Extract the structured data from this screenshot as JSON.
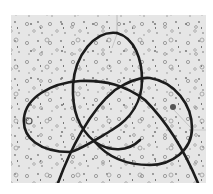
{
  "image": {
    "subject": "trefoil-knot-cord-on-speckled-background",
    "colors": {
      "background": "#ffffff",
      "photo_base": "#e4e4e4",
      "speckle": "#8a8a8a",
      "cord": "#1c1c1c",
      "thread": "#b0b0b0"
    }
  }
}
